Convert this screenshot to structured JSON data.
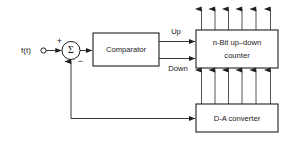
{
  "diagram": {
    "type": "block-diagram",
    "canvas": {
      "width": 284,
      "height": 144,
      "background": "#ffffff"
    },
    "line_color": "#1f1f1f",
    "text_color": "#1a1a1a",
    "source": {
      "label": "f(t)",
      "terminal": "open-circle"
    },
    "summing_junction": {
      "symbol": "Σ",
      "plus_sign": "+",
      "minus_sign": "−",
      "plus_input": "f(t)",
      "minus_input": "D-A converter feedback"
    },
    "blocks": [
      {
        "id": "comparator",
        "label": "Comparator",
        "x": 93,
        "y": 33,
        "width": 66,
        "height": 33
      },
      {
        "id": "counter",
        "label_line_1": "n-Bit up–down",
        "label_line_2": "counter",
        "x": 196,
        "y": 30,
        "width": 82,
        "height": 38
      },
      {
        "id": "dac",
        "label": "D-A converter",
        "x": 196,
        "y": 104,
        "width": 82,
        "height": 28
      }
    ],
    "signals": [
      {
        "id": "up",
        "label": "Up",
        "from": "comparator",
        "to": "counter"
      },
      {
        "id": "down",
        "label": "Down",
        "from": "comparator",
        "to": "counter"
      }
    ],
    "buses": [
      {
        "id": "counter-output-bus",
        "direction": "up",
        "line_count": 6,
        "from": "counter",
        "to": "external output"
      },
      {
        "id": "dac-input-bus",
        "direction": "up",
        "line_count": 6,
        "from": "dac",
        "to": "counter"
      }
    ],
    "feedback_path": {
      "from": "dac",
      "to": "summing_junction",
      "sign": "−"
    }
  }
}
